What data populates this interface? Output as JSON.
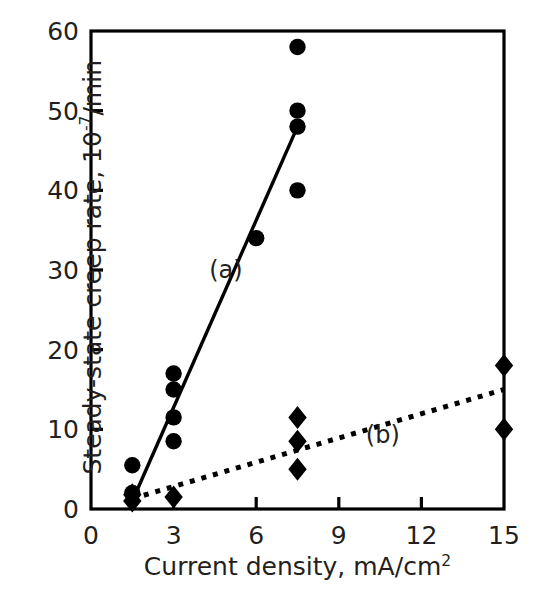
{
  "chart_data": {
    "type": "scatter",
    "title": "",
    "xlabel": "Current density, mA/cm²",
    "ylabel": "Steady-state creep rate, 10⁻⁷/min",
    "xlim": [
      0,
      15
    ],
    "ylim": [
      0,
      60
    ],
    "xticks": [
      0,
      3,
      6,
      9,
      12,
      15
    ],
    "yticks": [
      0,
      10,
      20,
      30,
      40,
      50,
      60
    ],
    "xtick_labels": [
      "0",
      "3",
      "6",
      "9",
      "12",
      "15"
    ],
    "ytick_labels": [
      "0",
      "10",
      "20",
      "30",
      "40",
      "50",
      "60"
    ],
    "grid": false,
    "legend_position": "inline-annotations",
    "series": [
      {
        "name": "(a)",
        "marker": "circle",
        "color": "#000000",
        "annotation": "(a)",
        "annotation_x": 4.9,
        "annotation_y": 30.0,
        "fit_line": {
          "style": "solid",
          "x": [
            1.5,
            7.5
          ],
          "y": [
            1.0,
            48.0
          ]
        },
        "points": [
          {
            "x": 1.5,
            "y": 2.0
          },
          {
            "x": 1.5,
            "y": 5.5
          },
          {
            "x": 3.0,
            "y": 8.5
          },
          {
            "x": 3.0,
            "y": 11.5
          },
          {
            "x": 3.0,
            "y": 15.0
          },
          {
            "x": 3.0,
            "y": 17.0
          },
          {
            "x": 6.0,
            "y": 34.0
          },
          {
            "x": 7.5,
            "y": 40.0
          },
          {
            "x": 7.5,
            "y": 48.0
          },
          {
            "x": 7.5,
            "y": 50.0
          },
          {
            "x": 7.5,
            "y": 58.0
          }
        ]
      },
      {
        "name": "(b)",
        "marker": "diamond",
        "color": "#000000",
        "annotation": "(b)",
        "annotation_x": 10.6,
        "annotation_y": 9.3,
        "fit_line": {
          "style": "dotted",
          "x": [
            1.5,
            15.0
          ],
          "y": [
            1.3,
            15.0
          ]
        },
        "points": [
          {
            "x": 1.5,
            "y": 1.0
          },
          {
            "x": 1.5,
            "y": 1.8
          },
          {
            "x": 3.0,
            "y": 1.5
          },
          {
            "x": 7.5,
            "y": 5.0
          },
          {
            "x": 7.5,
            "y": 8.5
          },
          {
            "x": 7.5,
            "y": 11.5
          },
          {
            "x": 15.0,
            "y": 10.0
          },
          {
            "x": 15.0,
            "y": 18.0
          }
        ]
      }
    ]
  },
  "axis": {
    "y_title_main": "Steady-state creep rate, 10",
    "y_title_exp": "-7",
    "y_title_tail": "/min",
    "x_title_main": "Current density, mA/cm",
    "x_title_exp": "2"
  },
  "colors": {
    "axis": "#000000",
    "marker": "#000000",
    "text": "#231f20",
    "background": "#ffffff"
  }
}
